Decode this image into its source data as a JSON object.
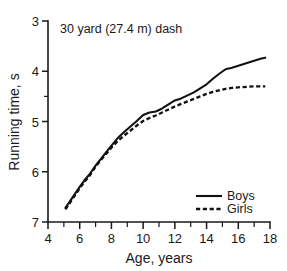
{
  "chart_data": {
    "type": "line",
    "title": "30 yard (27.4 m) dash",
    "xlabel": "Age, years",
    "ylabel": "Running time, s",
    "xlim": [
      4,
      18
    ],
    "ylim": [
      7,
      3
    ],
    "y_inverted": true,
    "grid": false,
    "legend_position": "bottom-right",
    "x_ticks_major": [
      4,
      6,
      8,
      10,
      12,
      14,
      16,
      18
    ],
    "x_ticks_minor": [
      5,
      7,
      9,
      11,
      13,
      15,
      17
    ],
    "y_ticks_major": [
      3,
      4,
      5,
      6,
      7
    ],
    "y_ticks_minor": [
      4.5
    ],
    "x_tick_labels": [
      "4",
      "6",
      "8",
      "10",
      "12",
      "14",
      "16",
      "18"
    ],
    "y_tick_labels": [
      "3",
      "4",
      "5",
      "6",
      "7"
    ],
    "series": [
      {
        "name": "Boys",
        "style": "solid",
        "x": [
          5.1,
          5.4,
          5.7,
          6.0,
          6.3,
          6.6,
          7.0,
          7.3,
          7.6,
          8.0,
          8.4,
          8.8,
          9.2,
          9.6,
          10.0,
          10.4,
          10.8,
          11.2,
          11.6,
          12.0,
          12.4,
          12.8,
          13.2,
          13.6,
          14.0,
          14.4,
          14.8,
          15.2,
          15.6,
          16.0,
          16.5,
          17.0,
          17.4,
          17.7
        ],
        "y": [
          6.72,
          6.58,
          6.44,
          6.3,
          6.17,
          6.06,
          5.88,
          5.76,
          5.64,
          5.48,
          5.33,
          5.21,
          5.1,
          4.99,
          4.87,
          4.82,
          4.8,
          4.74,
          4.66,
          4.58,
          4.54,
          4.48,
          4.42,
          4.34,
          4.26,
          4.15,
          4.05,
          3.96,
          3.93,
          3.89,
          3.84,
          3.79,
          3.75,
          3.73
        ]
      },
      {
        "name": "Girls",
        "style": "dashed",
        "x": [
          5.1,
          5.4,
          5.7,
          6.0,
          6.3,
          6.6,
          7.0,
          7.3,
          7.6,
          8.0,
          8.4,
          8.8,
          9.2,
          9.6,
          10.0,
          10.4,
          10.8,
          11.2,
          11.6,
          12.0,
          12.4,
          12.8,
          13.2,
          13.6,
          14.0,
          14.4,
          14.8,
          15.2,
          15.6,
          16.0,
          16.5,
          17.0,
          17.4,
          17.7
        ],
        "y": [
          6.75,
          6.61,
          6.47,
          6.33,
          6.2,
          6.09,
          5.9,
          5.78,
          5.67,
          5.52,
          5.39,
          5.28,
          5.18,
          5.08,
          4.99,
          4.93,
          4.88,
          4.82,
          4.76,
          4.7,
          4.65,
          4.6,
          4.55,
          4.5,
          4.45,
          4.41,
          4.38,
          4.35,
          4.33,
          4.32,
          4.31,
          4.3,
          4.3,
          4.3
        ]
      }
    ]
  },
  "legend": {
    "items": [
      {
        "label": "Boys",
        "style": "solid"
      },
      {
        "label": "Girls",
        "style": "dashed"
      }
    ]
  }
}
